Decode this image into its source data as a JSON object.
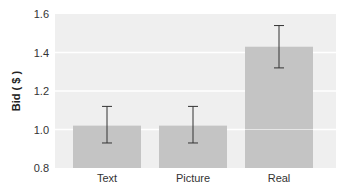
{
  "chart_data": {
    "type": "bar",
    "title": "",
    "xlabel": "",
    "ylabel": "Bid ( $ )",
    "categories": [
      "Text",
      "Picture",
      "Real"
    ],
    "values": [
      1.02,
      1.02,
      1.43
    ],
    "error_bars": [
      {
        "low": 0.93,
        "high": 1.12
      },
      {
        "low": 0.93,
        "high": 1.12
      },
      {
        "low": 1.32,
        "high": 1.54
      }
    ],
    "ylim": [
      0.8,
      1.6
    ],
    "yticks": [
      "0.8",
      "1.0",
      "1.2",
      "1.4",
      "1.6"
    ],
    "grid": true,
    "legend": null,
    "colors": {
      "bar": "#c4c4c4",
      "plot_bg": "#efefef",
      "grid": "#ffffff",
      "errorbar": "#333333"
    }
  }
}
